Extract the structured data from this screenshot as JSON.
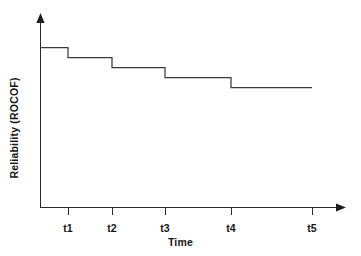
{
  "chart_data": {
    "type": "line",
    "subtype": "step-post",
    "title": "",
    "xlabel": "Time",
    "ylabel": "Reliability (ROCOF)",
    "grid": false,
    "legend": null,
    "x_tick_labels": [
      "t1",
      "t2",
      "t3",
      "t4",
      "t5"
    ],
    "x_tick_positions": [
      68,
      112,
      165,
      231,
      312
    ],
    "y_tick_labels": [],
    "xlim": [
      40,
      345
    ],
    "ylim_pixels": [
      207,
      14
    ],
    "axis_origin": {
      "x": 40,
      "y": 207
    },
    "axis_x_end": 345,
    "axis_y_top": 14,
    "series": [
      {
        "name": "ROCOF",
        "points": [
          {
            "x": 40,
            "y": 47
          },
          {
            "x": 68,
            "y": 47
          },
          {
            "x": 68,
            "y": 57
          },
          {
            "x": 112,
            "y": 57
          },
          {
            "x": 112,
            "y": 67
          },
          {
            "x": 165,
            "y": 67
          },
          {
            "x": 165,
            "y": 77
          },
          {
            "x": 231,
            "y": 77
          },
          {
            "x": 231,
            "y": 87
          },
          {
            "x": 312,
            "y": 87
          }
        ],
        "segment_levels": [
          47,
          57,
          67,
          77,
          87
        ],
        "segment_spans": [
          [
            40,
            68
          ],
          [
            68,
            112
          ],
          [
            112,
            165
          ],
          [
            165,
            231
          ],
          [
            231,
            312
          ]
        ]
      }
    ]
  },
  "colors": {
    "background": "#ffffff",
    "axis": "#2b2b2b",
    "data_line": "#3a3a3a",
    "text": "#151515"
  },
  "axes": {
    "x_label": "Time",
    "y_label": "Reliability (ROCOF)"
  },
  "ticks": [
    {
      "label": "t1",
      "left": 68
    },
    {
      "label": "t2",
      "left": 112
    },
    {
      "label": "t3",
      "left": 165
    },
    {
      "label": "t4",
      "left": 231
    },
    {
      "label": "t5",
      "left": 312
    }
  ]
}
